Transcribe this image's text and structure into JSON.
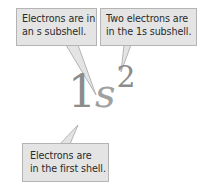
{
  "diagram": {
    "notation": {
      "shell_number": "1",
      "subshell_letter": "s",
      "electron_count": "2"
    },
    "callouts": {
      "subshell": {
        "lines": [
          "Electrons are in",
          "an s subshell."
        ],
        "points_to": "s"
      },
      "count": {
        "lines": [
          "Two electrons are",
          "in the 1s subshell."
        ],
        "points_to": "2"
      },
      "shell": {
        "lines": [
          "Electrons are",
          "in the first shell."
        ],
        "points_to": "1"
      }
    },
    "colors": {
      "callout_fill": "#e4e4e4",
      "callout_border": "#b4b4b4",
      "callout_text": "#2a2a2a",
      "notation_text": "#8c8c8c"
    }
  }
}
